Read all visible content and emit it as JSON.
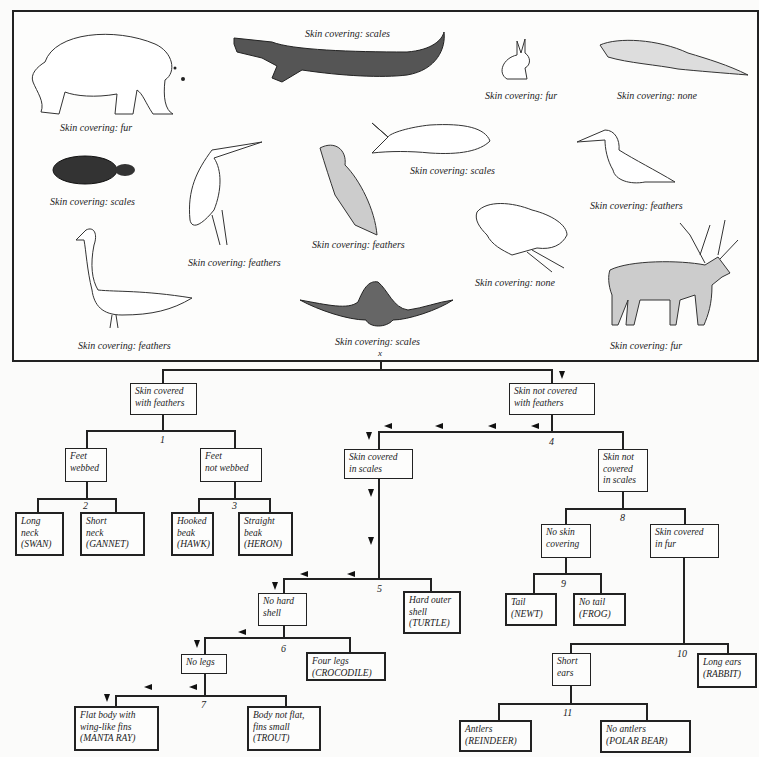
{
  "panel": {
    "animals": [
      {
        "id": "polar-bear",
        "caption": "Skin covering: fur"
      },
      {
        "id": "crocodile",
        "caption": "Skin covering: scales"
      },
      {
        "id": "rabbit",
        "caption": "Skin covering: fur"
      },
      {
        "id": "newt",
        "caption": "Skin covering: none"
      },
      {
        "id": "turtle",
        "caption": "Skin covering: scales"
      },
      {
        "id": "heron",
        "caption": "Skin covering: feathers"
      },
      {
        "id": "hawk",
        "caption": "Skin covering: feathers"
      },
      {
        "id": "trout",
        "caption": "Skin covering: scales"
      },
      {
        "id": "gannet",
        "caption": "Skin covering: feathers"
      },
      {
        "id": "swan",
        "caption": "Skin covering: feathers"
      },
      {
        "id": "manta-ray",
        "caption": "Skin covering: scales"
      },
      {
        "id": "frog",
        "caption": "Skin covering: none"
      },
      {
        "id": "reindeer",
        "caption": "Skin covering: fur"
      }
    ],
    "root_label": "x"
  },
  "key": {
    "nodes": {
      "feathers": [
        "Skin covered",
        "with feathers"
      ],
      "not_feathers": [
        "Skin not covered",
        "with feathers"
      ],
      "feet_webbed": [
        "Feet",
        "webbed"
      ],
      "feet_not_webbed": [
        "Feet",
        "not webbed"
      ],
      "swan": [
        "Long",
        "neck",
        "(SWAN)"
      ],
      "gannet": [
        "Short",
        "neck",
        "(GANNET)"
      ],
      "hawk": [
        "Hooked",
        "beak",
        "(HAWK)"
      ],
      "heron": [
        "Straight",
        "beak",
        "(HERON)"
      ],
      "scales": [
        "Skin covered",
        "in scales"
      ],
      "not_scales": [
        "Skin not",
        "covered",
        "in scales"
      ],
      "no_skin": [
        "No skin",
        "covering"
      ],
      "fur": [
        "Skin covered",
        "in fur"
      ],
      "newt": [
        "Tail",
        "(NEWT)"
      ],
      "frog": [
        "No tail",
        "(FROG)"
      ],
      "no_shell": [
        "No hard",
        "shell"
      ],
      "turtle": [
        "Hard outer",
        "shell",
        "(TURTLE)"
      ],
      "no_legs": [
        "No legs"
      ],
      "crocodile": [
        "Four legs",
        "(CROCODILE)"
      ],
      "manta": [
        "Flat body with",
        "wing-like fins",
        "(MANTA RAY)"
      ],
      "trout": [
        "Body not flat,",
        "fins small",
        "(TROUT)"
      ],
      "short_ears": [
        "Short",
        "ears"
      ],
      "rabbit": [
        "Long ears",
        "(RABBIT)"
      ],
      "reindeer": [
        "Antlers",
        "(REINDEER)"
      ],
      "polar_bear": [
        "No antlers",
        "(POLAR BEAR)"
      ]
    },
    "numbers": [
      "1",
      "2",
      "3",
      "4",
      "5",
      "6",
      "7",
      "8",
      "9",
      "10",
      "11"
    ]
  },
  "colors": {
    "ink": "#222222",
    "paper": "#fbfbfa"
  }
}
